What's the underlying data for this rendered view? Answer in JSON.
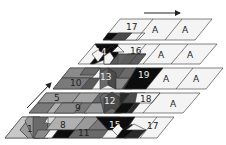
{
  "diagram": {
    "arrows": {
      "top": {
        "direction": "right"
      },
      "left": {
        "direction": "up-right"
      }
    },
    "colors": {
      "white": "#f4f4f4",
      "light": "#c8c8c8",
      "mid": "#9a9a9a",
      "dark": "#6a6a6a",
      "darker": "#4a4a4a",
      "black": "#0d0d0d",
      "stroke": "#333333"
    },
    "layers": [
      {
        "id": "layer-1",
        "labels": [
          "17",
          "A",
          "A"
        ]
      },
      {
        "id": "layer-2",
        "labels": [
          "14",
          "16",
          "A",
          "A"
        ]
      },
      {
        "id": "layer-3",
        "labels": [
          "10",
          "13",
          "19",
          "A",
          "A"
        ]
      },
      {
        "id": "layer-4",
        "labels": [
          "5",
          "9",
          "12",
          "18",
          "A"
        ]
      },
      {
        "id": "layer-5",
        "labels": [
          "1",
          "8",
          "11",
          "15",
          "17"
        ]
      }
    ]
  }
}
